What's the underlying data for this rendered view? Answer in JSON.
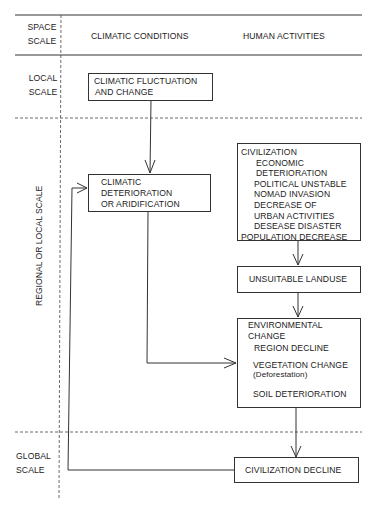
{
  "header": {
    "space_scale": [
      "SPACE",
      "SCALE"
    ],
    "climatic_conditions": "CLIMATIC CONDITIONS",
    "human_activities": "HUMAN ACTIVITIES"
  },
  "scales": {
    "local": [
      "LOCAL",
      "SCALE"
    ],
    "regional": "REGIONAL  OR LOCAL  SCALE",
    "global": [
      "GLOBAL",
      "SCALE"
    ]
  },
  "boxes": {
    "climatic_fluctuation": [
      "CLIMATIC FLUCTUATION",
      "AND CHANGE"
    ],
    "climatic_deterioration": [
      "CLIMATIC",
      "DETERIORATION",
      "OR ARIDIFICATION"
    ],
    "civilization": {
      "title": "CIVILIZATION",
      "items": [
        "ECONOMIC",
        "DETERIORATION",
        "POLITICAL UNSTABLE",
        "NOMAD INVASION",
        "DECREASE OF",
        "URBAN ACTIVITIES",
        "DESEASE DISASTER"
      ],
      "last": "POPULATION DECREASE"
    },
    "unsuitable_landuse": "UNSUITABLE LANDUSE",
    "environmental_change": {
      "title": [
        "ENVIRONMENTAL",
        "CHANGE"
      ],
      "region_decline": "REGION DECLINE",
      "vegetation_change": "VEGETATION CHANGE",
      "deforestation": "(Deforestation)",
      "soil_deterioration": "SOIL DETERIORATION"
    },
    "civilization_decline": "CIVILIZATION DECLINE"
  },
  "colors": {
    "line": "#333333",
    "background": "#ffffff"
  }
}
